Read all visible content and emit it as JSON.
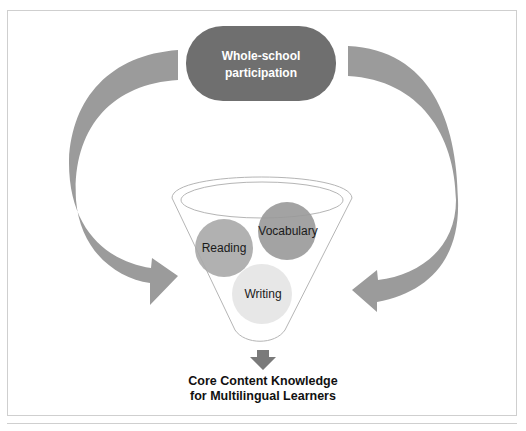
{
  "diagram": {
    "top_box": {
      "line1": "Whole-school",
      "line2": "participation"
    },
    "circles": [
      {
        "label": "Reading"
      },
      {
        "label": "Vocabulary"
      },
      {
        "label": "Writing"
      }
    ],
    "output": {
      "line1": "Core Content Knowledge",
      "line2": "for Multilingual Learners"
    },
    "colors": {
      "pill": "#6f6f6f",
      "arrows": "#9b9b9b",
      "reading": "#a8a8a8",
      "vocabulary": "#999999",
      "writing": "#e6e6e6",
      "funnel_stroke": "#b5b5b5"
    }
  }
}
